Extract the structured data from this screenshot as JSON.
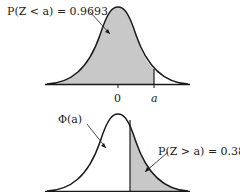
{
  "top": {
    "annotation": "P(Z < a) = 0.9693",
    "tick_zero": "0",
    "tick_a": "a"
  },
  "bottom": {
    "annotation_left": "Φ(a)",
    "annotation_right": "P(Z > a) = 0.38"
  },
  "colors": {
    "shade": "#c8c8c8",
    "line": "#1a1a1a"
  }
}
